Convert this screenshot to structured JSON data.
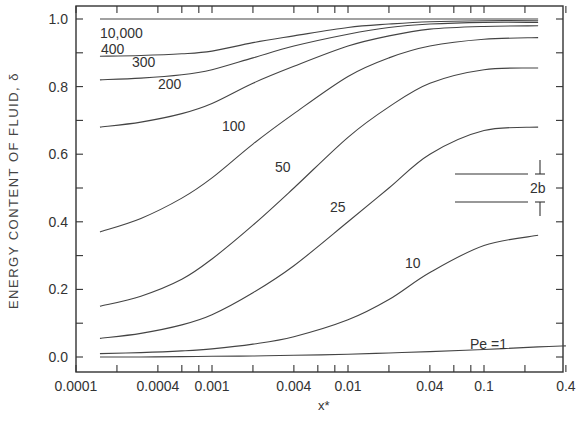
{
  "chart_data": {
    "type": "line",
    "title": "",
    "xlabel": "x*",
    "ylabel": "ENERGY CONTENT OF FLUID, δ",
    "x_scale": "log",
    "xlim": [
      0.0001,
      0.4
    ],
    "ylim": [
      0.0,
      1.0
    ],
    "grid": false,
    "legend_position": "inline curve labels",
    "x_tick_labels": [
      "0.0001",
      "0.0004",
      "0.001",
      "0.004",
      "0.01",
      "0.04",
      "0.1",
      "0.4"
    ],
    "x_ticks": [
      0.0001,
      0.0002,
      0.0004,
      0.0006,
      0.0008,
      0.001,
      0.002,
      0.004,
      0.006,
      0.008,
      0.01,
      0.02,
      0.04,
      0.06,
      0.08,
      0.1,
      0.2,
      0.4
    ],
    "y_tick_labels": [
      "0.0",
      "0.2",
      "0.4",
      "0.6",
      "0.8",
      "1.0"
    ],
    "y_ticks": [
      0.0,
      0.1,
      0.2,
      0.3,
      0.4,
      0.5,
      0.6,
      0.7,
      0.8,
      0.9,
      1.0
    ],
    "x": [
      0.00015,
      0.0003,
      0.0006,
      0.001,
      0.002,
      0.004,
      0.01,
      0.02,
      0.04,
      0.1,
      0.25
    ],
    "series": [
      {
        "name": "Pe = 1",
        "label": "Pe =1",
        "values": [
          0.0,
          0.0,
          0.001,
          0.002,
          0.003,
          0.005,
          0.008,
          0.012,
          0.016,
          0.022,
          0.03
        ]
      },
      {
        "name": "Pe = 10",
        "label": "10",
        "values": [
          0.01,
          0.013,
          0.018,
          0.024,
          0.038,
          0.06,
          0.11,
          0.17,
          0.25,
          0.33,
          0.36
        ]
      },
      {
        "name": "Pe = 25",
        "label": "25",
        "values": [
          0.055,
          0.07,
          0.095,
          0.125,
          0.19,
          0.27,
          0.4,
          0.5,
          0.6,
          0.67,
          0.68
        ]
      },
      {
        "name": "Pe = 50",
        "label": "50",
        "values": [
          0.15,
          0.18,
          0.23,
          0.29,
          0.39,
          0.5,
          0.65,
          0.74,
          0.81,
          0.85,
          0.855
        ]
      },
      {
        "name": "Pe = 100",
        "label": "100",
        "values": [
          0.37,
          0.41,
          0.47,
          0.53,
          0.63,
          0.72,
          0.83,
          0.885,
          0.92,
          0.94,
          0.945
        ]
      },
      {
        "name": "Pe = 200",
        "label": "200",
        "values": [
          0.68,
          0.695,
          0.72,
          0.75,
          0.81,
          0.86,
          0.92,
          0.95,
          0.97,
          0.978,
          0.98
        ]
      },
      {
        "name": "Pe = 300",
        "label": "300",
        "values": [
          0.82,
          0.825,
          0.835,
          0.85,
          0.885,
          0.92,
          0.955,
          0.975,
          0.985,
          0.99,
          0.99
        ]
      },
      {
        "name": "Pe = 400",
        "label": "400",
        "values": [
          0.89,
          0.892,
          0.897,
          0.905,
          0.93,
          0.95,
          0.975,
          0.985,
          0.992,
          0.995,
          0.995
        ]
      },
      {
        "name": "Pe = 10,000",
        "label": "10,000",
        "values": [
          1.0,
          1.0,
          1.0,
          1.0,
          1.0,
          1.0,
          1.0,
          1.0,
          1.0,
          1.0,
          1.0
        ]
      }
    ],
    "annotations": [
      {
        "text": "2b",
        "description": "channel half-width schematic: two parallel plates with dimension arrows"
      }
    ]
  },
  "labels": {
    "ylabel": "ENERGY CONTENT OF FLUID, δ",
    "xlabel": "x*",
    "schematic": "2b"
  }
}
